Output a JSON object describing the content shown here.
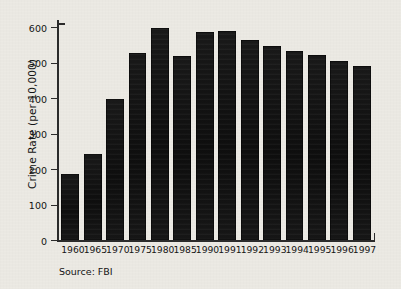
{
  "figure": {
    "background_color": "#eceae4",
    "ink_color": "#141414",
    "source_note": "Source: FBI"
  },
  "chart_data": {
    "type": "bar",
    "title": "",
    "xlabel": "",
    "ylabel": "Crime Rate (per 10,000)",
    "categories": [
      "1960",
      "1965",
      "1970",
      "1975",
      "1980",
      "1985",
      "1990",
      "1991",
      "1992",
      "1993",
      "1994",
      "1995",
      "1996",
      "1997"
    ],
    "values": [
      186,
      242,
      398,
      528,
      597,
      519,
      586,
      589,
      564,
      546,
      533,
      522,
      505,
      490
    ],
    "ylim": [
      0,
      620
    ],
    "yticks": [
      0,
      100,
      200,
      300,
      400,
      500,
      600
    ],
    "ytick_labels": [
      "0",
      "100",
      "200",
      "300",
      "400",
      "500",
      "600"
    ],
    "grid": false,
    "legend": null,
    "bar_color": "#141414",
    "series": [
      {
        "name": "Crime Rate (per 10,000)",
        "values": [
          186,
          242,
          398,
          528,
          597,
          519,
          586,
          589,
          564,
          546,
          533,
          522,
          505,
          490
        ]
      }
    ]
  }
}
